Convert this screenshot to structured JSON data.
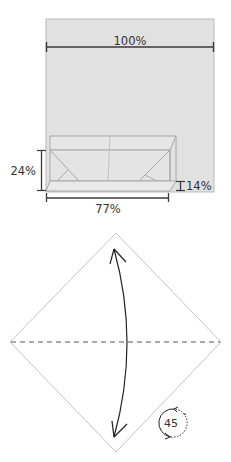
{
  "diagram": {
    "step1": {
      "name": "box-proportions",
      "labels": {
        "width_full": "100%",
        "box_width": "77%",
        "box_height": "24%",
        "flap_height": "14%"
      },
      "colors": {
        "paper_fill": "#e1e1e1",
        "paper_edge": "#b9b9b9",
        "box_line": "#a8a8a8",
        "dimension_line": "#3a3a3a"
      }
    },
    "step2": {
      "name": "diamond-fold",
      "fold_type": "valley fold and unfold",
      "rotation_label": "45",
      "rotation_unit": "°",
      "colors": {
        "edge": "#c4c4c4",
        "fold_line": "#555555",
        "arrow": "#222222"
      }
    }
  }
}
